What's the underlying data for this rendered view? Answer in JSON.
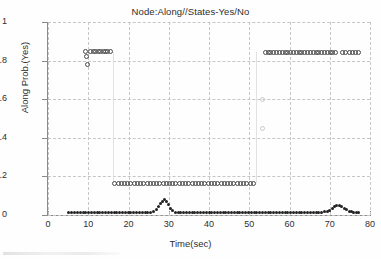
{
  "chart_data": {
    "type": "scatter",
    "title": "Node:Along//States-Yes/No",
    "xlabel": "Time(sec)",
    "ylabel": "Along Prob.(Yes)",
    "xlim": [
      0,
      80
    ],
    "ylim": [
      0,
      1
    ],
    "xticks": [
      0,
      10,
      20,
      30,
      40,
      50,
      60,
      70,
      80
    ],
    "yticks": [
      0,
      0.2,
      0.4,
      0.6,
      0.8,
      1
    ],
    "grid": true,
    "legend": "none",
    "series": [
      {
        "name": "high-plateau-left",
        "marker": "circle-open",
        "points": [
          [
            9.2,
            0.845
          ],
          [
            9.6,
            0.82
          ],
          [
            9.7,
            0.78
          ],
          [
            10.6,
            0.845
          ],
          [
            11.3,
            0.845
          ],
          [
            11.9,
            0.845
          ],
          [
            12.5,
            0.845
          ],
          [
            13.1,
            0.845
          ],
          [
            13.7,
            0.845
          ],
          [
            14.3,
            0.845
          ],
          [
            14.9,
            0.845
          ],
          [
            15.5,
            0.845
          ]
        ]
      },
      {
        "name": "transition-down-left",
        "marker": "line-faint",
        "points": [
          [
            16.1,
            0.845
          ],
          [
            16.1,
            0.165
          ]
        ]
      },
      {
        "name": "mid-plateau",
        "marker": "circle-open",
        "points": [
          [
            16.6,
            0.165
          ],
          [
            17.4,
            0.165
          ],
          [
            18.2,
            0.165
          ],
          [
            19.0,
            0.165
          ],
          [
            19.8,
            0.165
          ],
          [
            20.6,
            0.165
          ],
          [
            21.4,
            0.165
          ],
          [
            22.2,
            0.165
          ],
          [
            23.0,
            0.165
          ],
          [
            23.8,
            0.165
          ],
          [
            24.6,
            0.165
          ],
          [
            25.4,
            0.165
          ],
          [
            26.2,
            0.165
          ],
          [
            27.0,
            0.165
          ],
          [
            27.8,
            0.165
          ],
          [
            28.6,
            0.165
          ],
          [
            29.4,
            0.165
          ],
          [
            30.2,
            0.165
          ],
          [
            31.0,
            0.165
          ],
          [
            31.8,
            0.165
          ],
          [
            32.6,
            0.165
          ],
          [
            33.4,
            0.165
          ],
          [
            34.2,
            0.165
          ],
          [
            35.0,
            0.165
          ],
          [
            35.8,
            0.165
          ],
          [
            36.6,
            0.165
          ],
          [
            37.4,
            0.165
          ],
          [
            38.2,
            0.165
          ],
          [
            39.0,
            0.165
          ],
          [
            39.8,
            0.165
          ],
          [
            40.6,
            0.165
          ],
          [
            41.4,
            0.165
          ],
          [
            42.2,
            0.165
          ],
          [
            43.0,
            0.165
          ],
          [
            43.8,
            0.165
          ],
          [
            44.6,
            0.165
          ],
          [
            45.4,
            0.165
          ],
          [
            46.2,
            0.165
          ],
          [
            47.0,
            0.165
          ],
          [
            47.8,
            0.165
          ],
          [
            48.6,
            0.165
          ],
          [
            49.4,
            0.165
          ],
          [
            50.2,
            0.165
          ],
          [
            51.0,
            0.165
          ]
        ]
      },
      {
        "name": "transition-up-right",
        "marker": "line-faint",
        "points": [
          [
            51.8,
            0.165
          ],
          [
            51.8,
            0.845
          ]
        ]
      },
      {
        "name": "transition-markers-right",
        "marker": "circle-faint",
        "points": [
          [
            53.4,
            0.6
          ],
          [
            53.4,
            0.45
          ]
        ]
      },
      {
        "name": "high-plateau-right",
        "marker": "circle-open",
        "points": [
          [
            54.0,
            0.84
          ],
          [
            54.7,
            0.84
          ],
          [
            55.4,
            0.84
          ],
          [
            56.1,
            0.84
          ],
          [
            56.8,
            0.84
          ],
          [
            57.5,
            0.84
          ],
          [
            58.2,
            0.84
          ],
          [
            58.9,
            0.84
          ],
          [
            59.6,
            0.84
          ],
          [
            60.3,
            0.84
          ],
          [
            61.0,
            0.84
          ],
          [
            61.7,
            0.84
          ],
          [
            62.4,
            0.84
          ],
          [
            63.1,
            0.84
          ],
          [
            63.8,
            0.84
          ],
          [
            64.5,
            0.84
          ],
          [
            65.2,
            0.84
          ],
          [
            65.9,
            0.84
          ],
          [
            66.6,
            0.84
          ],
          [
            67.3,
            0.84
          ],
          [
            68.0,
            0.84
          ],
          [
            68.7,
            0.84
          ],
          [
            69.4,
            0.84
          ],
          [
            70.1,
            0.84
          ],
          [
            70.8,
            0.84
          ],
          [
            71.5,
            0.84
          ],
          [
            73.2,
            0.84
          ],
          [
            74.0,
            0.84
          ],
          [
            74.8,
            0.84
          ],
          [
            75.6,
            0.84
          ],
          [
            76.4,
            0.84
          ],
          [
            77.2,
            0.84
          ]
        ]
      },
      {
        "name": "baseline-low",
        "marker": "dot-dark",
        "points": [
          [
            5.2,
            0.012
          ],
          [
            5.9,
            0.012
          ],
          [
            6.6,
            0.012
          ],
          [
            7.3,
            0.012
          ],
          [
            8.0,
            0.012
          ],
          [
            8.7,
            0.012
          ],
          [
            9.4,
            0.012
          ],
          [
            10.1,
            0.012
          ],
          [
            10.8,
            0.012
          ],
          [
            11.5,
            0.012
          ],
          [
            12.2,
            0.012
          ],
          [
            12.9,
            0.012
          ],
          [
            13.6,
            0.012
          ],
          [
            14.3,
            0.012
          ],
          [
            15.0,
            0.012
          ],
          [
            15.7,
            0.012
          ],
          [
            16.4,
            0.012
          ],
          [
            17.1,
            0.012
          ],
          [
            17.8,
            0.012
          ],
          [
            18.5,
            0.012
          ],
          [
            19.2,
            0.012
          ],
          [
            19.9,
            0.012
          ],
          [
            20.6,
            0.012
          ],
          [
            21.3,
            0.012
          ],
          [
            22.0,
            0.012
          ],
          [
            22.7,
            0.012
          ],
          [
            23.4,
            0.012
          ],
          [
            24.1,
            0.012
          ],
          [
            24.8,
            0.012
          ],
          [
            25.5,
            0.012
          ],
          [
            26.2,
            0.018
          ],
          [
            26.9,
            0.03
          ],
          [
            27.4,
            0.045
          ],
          [
            27.9,
            0.06
          ],
          [
            28.4,
            0.072
          ],
          [
            28.9,
            0.078
          ],
          [
            29.4,
            0.07
          ],
          [
            29.9,
            0.052
          ],
          [
            30.4,
            0.035
          ],
          [
            30.9,
            0.022
          ],
          [
            31.6,
            0.014
          ],
          [
            32.3,
            0.012
          ],
          [
            33.0,
            0.012
          ],
          [
            33.7,
            0.012
          ],
          [
            34.4,
            0.012
          ],
          [
            35.1,
            0.012
          ],
          [
            35.8,
            0.012
          ],
          [
            36.5,
            0.012
          ],
          [
            37.2,
            0.012
          ],
          [
            37.9,
            0.012
          ],
          [
            38.6,
            0.012
          ],
          [
            39.3,
            0.012
          ],
          [
            40.0,
            0.012
          ],
          [
            40.7,
            0.012
          ],
          [
            41.4,
            0.012
          ],
          [
            42.1,
            0.012
          ],
          [
            42.8,
            0.012
          ],
          [
            43.5,
            0.012
          ],
          [
            44.2,
            0.012
          ],
          [
            44.9,
            0.012
          ],
          [
            45.6,
            0.012
          ],
          [
            46.3,
            0.012
          ],
          [
            47.0,
            0.012
          ],
          [
            47.7,
            0.012
          ],
          [
            48.4,
            0.012
          ],
          [
            49.1,
            0.012
          ],
          [
            49.8,
            0.012
          ],
          [
            50.5,
            0.012
          ],
          [
            51.2,
            0.012
          ],
          [
            51.9,
            0.012
          ],
          [
            52.6,
            0.012
          ],
          [
            53.3,
            0.012
          ],
          [
            54.0,
            0.012
          ],
          [
            54.7,
            0.012
          ],
          [
            55.4,
            0.012
          ],
          [
            56.1,
            0.012
          ],
          [
            56.8,
            0.012
          ],
          [
            57.5,
            0.012
          ],
          [
            58.2,
            0.012
          ],
          [
            58.9,
            0.012
          ],
          [
            59.6,
            0.012
          ],
          [
            60.3,
            0.012
          ],
          [
            61.0,
            0.012
          ],
          [
            61.7,
            0.012
          ],
          [
            62.4,
            0.012
          ],
          [
            63.1,
            0.012
          ],
          [
            63.8,
            0.012
          ],
          [
            64.5,
            0.012
          ],
          [
            65.2,
            0.012
          ],
          [
            65.9,
            0.012
          ],
          [
            66.6,
            0.012
          ],
          [
            67.3,
            0.012
          ],
          [
            68.0,
            0.014
          ],
          [
            68.7,
            0.016
          ],
          [
            69.4,
            0.018
          ],
          [
            70.0,
            0.024
          ],
          [
            70.6,
            0.034
          ],
          [
            71.2,
            0.044
          ],
          [
            71.8,
            0.05
          ],
          [
            72.4,
            0.05
          ],
          [
            73.0,
            0.044
          ],
          [
            73.6,
            0.034
          ],
          [
            74.2,
            0.026
          ],
          [
            74.8,
            0.02
          ],
          [
            75.4,
            0.016
          ],
          [
            76.0,
            0.014
          ],
          [
            76.6,
            0.012
          ],
          [
            77.2,
            0.012
          ]
        ]
      }
    ]
  }
}
